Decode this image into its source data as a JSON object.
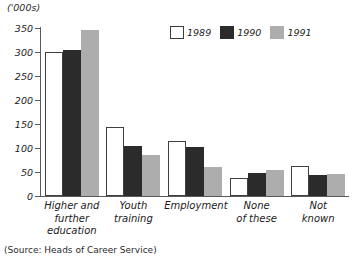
{
  "units_label": "('000s)",
  "source_note": "(Source: Heads of Career Service)",
  "legend": {
    "entries": [
      {
        "label": "1989",
        "swatch": "white-square-swatch",
        "color": "#ffffff"
      },
      {
        "label": "1990",
        "swatch": "black-square-swatch",
        "color": "#2b2b2b"
      },
      {
        "label": "1991",
        "swatch": "gray-square-swatch",
        "color": "#adadad"
      }
    ]
  },
  "chart_data": {
    "type": "bar",
    "title": "",
    "subtitle": "",
    "xlabel": "",
    "ylabel": "('000s)",
    "ylim": [
      0,
      350
    ],
    "yticks": [
      0,
      50,
      100,
      150,
      200,
      250,
      300,
      350
    ],
    "ytick_labels": [
      "0",
      "50",
      "100",
      "150",
      "200",
      "250",
      "300",
      "350"
    ],
    "grid": false,
    "legend_position": "top-right",
    "categories": [
      "Higher and further education",
      "Youth training",
      "Employment",
      "None of these",
      "Not known"
    ],
    "category_lines": [
      [
        "Higher and",
        "further",
        "education"
      ],
      [
        "Youth",
        "training"
      ],
      [
        "Employment"
      ],
      [
        "None",
        "of these"
      ],
      [
        "Not",
        "known"
      ]
    ],
    "series": [
      {
        "name": "1989",
        "color": "#ffffff",
        "values": [
          300,
          143,
          115,
          38,
          62
        ]
      },
      {
        "name": "1990",
        "color": "#2b2b2b",
        "values": [
          305,
          104,
          103,
          47,
          44
        ]
      },
      {
        "name": "1991",
        "color": "#adadad",
        "values": [
          345,
          86,
          60,
          55,
          45
        ]
      }
    ],
    "annotations": [],
    "source": "(Source: Heads of Career Service)"
  }
}
